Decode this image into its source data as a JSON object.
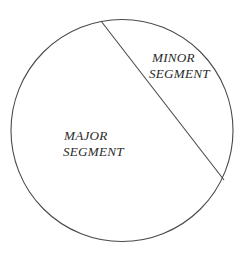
{
  "figure": {
    "type": "geometry-diagram",
    "background_color": "#ffffff",
    "stroke_color": "#4a4a4a",
    "text_color": "#2b2b2b",
    "canvas": {
      "width": 250,
      "height": 261
    }
  },
  "chart_data": {
    "type": "diagram",
    "title": "",
    "shapes": [
      {
        "name": "circle",
        "kind": "circle",
        "center_x": 122,
        "center_y": 130,
        "radius": 111,
        "stroke": "#4a4a4a",
        "fill": "none"
      },
      {
        "name": "chord",
        "kind": "line",
        "x1": 101,
        "y1": 21,
        "x2": 224,
        "y2": 180,
        "stroke": "#4a4a4a"
      }
    ],
    "regions": [
      {
        "name": "minor-segment",
        "label_line_1": "MINOR",
        "label_line_2": "SEGMENT",
        "position": "upper-right",
        "fill": "none"
      },
      {
        "name": "major-segment",
        "label_line_1": "MAJOR",
        "label_line_2": "SEGMENT",
        "position": "lower-left",
        "fill": "none"
      }
    ],
    "xlabel": "",
    "ylabel": "",
    "legend": []
  },
  "labels": {
    "minor": {
      "line1": "MINOR",
      "line2": "SEGMENT"
    },
    "major": {
      "line1": "MAJOR",
      "line2": "SEGMENT"
    }
  }
}
